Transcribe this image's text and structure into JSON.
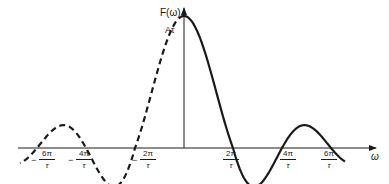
{
  "diagram": {
    "y_axis_label": "F(ω)",
    "x_axis_label": "ω",
    "peak_label": "Aτ",
    "tick_labels": [
      {
        "sign": "−",
        "num": "6π",
        "den": "τ",
        "x": 37
      },
      {
        "sign": "−",
        "num": "4π",
        "den": "τ",
        "x": 86
      },
      {
        "sign": "−",
        "num": "2π",
        "den": "τ",
        "x": 135
      },
      {
        "sign": "",
        "num": "2π",
        "den": "τ",
        "x": 233
      },
      {
        "sign": "",
        "num": "4π",
        "den": "τ",
        "x": 282
      },
      {
        "sign": "",
        "num": "6π",
        "den": "τ",
        "x": 330
      }
    ],
    "curve": {
      "type": "sinc",
      "negative_side_style": "dashed",
      "positive_side_style": "solid",
      "color": "#1a1a1a"
    }
  },
  "labels": {
    "t0_sign": "−",
    "t0_num": "6π",
    "t0_den": "τ",
    "t1_sign": "−",
    "t1_num": "4π",
    "t1_den": "τ",
    "t2_sign": "−",
    "t2_num": "2π",
    "t2_den": "τ",
    "t3_num": "2π",
    "t3_den": "τ",
    "t4_num": "4π",
    "t4_den": "τ",
    "t5_num": "6π",
    "t5_den": "τ"
  }
}
